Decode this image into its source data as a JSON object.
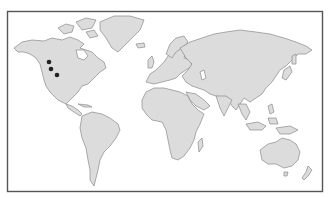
{
  "map": {
    "type": "world-outline",
    "projection": "equirectangular-like",
    "colors": {
      "background": "#ffffff",
      "frame": "#555555",
      "land_fill": "#dcdcdc",
      "land_stroke": "#8a8a8a",
      "marker": "#222222"
    },
    "frame": {
      "x": 7,
      "y": 11,
      "width": 316,
      "height": 181
    },
    "markers": [
      {
        "label": "",
        "x": 49,
        "y": 62
      },
      {
        "label": "",
        "x": 51,
        "y": 69
      },
      {
        "label": "",
        "x": 57,
        "y": 75
      }
    ]
  }
}
